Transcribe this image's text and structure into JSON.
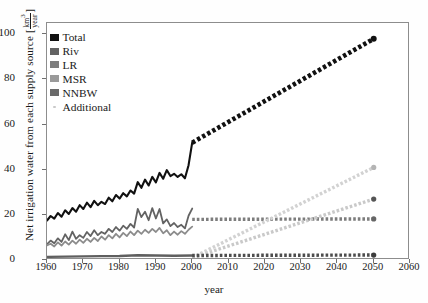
{
  "chart_data": {
    "type": "line",
    "title": "",
    "xlabel": "year",
    "ylabel": "Net irrigation water from each supply source",
    "yunit_num": "km",
    "yunit_num_sup": "3",
    "yunit_den": "year",
    "xlim": [
      1960,
      2060
    ],
    "ylim": [
      0,
      105
    ],
    "xticks": [
      1960,
      1970,
      1980,
      1990,
      2000,
      2010,
      2020,
      2030,
      2040,
      2050,
      2060
    ],
    "yticks": [
      0,
      20,
      40,
      60,
      80,
      100
    ],
    "grid": false,
    "legend_position": "top-left",
    "legend": [
      {
        "label": "Total",
        "color": "#111111",
        "marker": "square"
      },
      {
        "label": "Riv",
        "color": "#636363",
        "marker": "square"
      },
      {
        "label": "LR",
        "color": "#7d7d7d",
        "marker": "square"
      },
      {
        "label": "MSR",
        "color": "#9a9a9a",
        "marker": "square"
      },
      {
        "label": "NNBW",
        "color": "#6a6a6a",
        "marker": "square"
      },
      {
        "label": "Additional",
        "color": "#c9c9c9",
        "marker": "dot"
      }
    ],
    "series": [
      {
        "name": "Total",
        "color": "#111111",
        "style": "solid",
        "x": [
          1960,
          1961,
          1962,
          1963,
          1964,
          1965,
          1966,
          1967,
          1968,
          1969,
          1970,
          1971,
          1972,
          1973,
          1974,
          1975,
          1976,
          1977,
          1978,
          1979,
          1980,
          1981,
          1982,
          1983,
          1984,
          1985,
          1986,
          1987,
          1988,
          1989,
          1990,
          1991,
          1992,
          1993,
          1994,
          1995,
          1996,
          1997,
          1998,
          1999,
          2000
        ],
        "values": [
          17.5,
          19.5,
          18.3,
          20.8,
          19.2,
          22.0,
          20.4,
          23.0,
          21.4,
          24.3,
          22.6,
          25.4,
          23.4,
          26.2,
          24.3,
          25.8,
          24.8,
          27.6,
          26.0,
          28.8,
          27.2,
          29.6,
          28.2,
          30.8,
          29.4,
          34.5,
          32.0,
          35.6,
          33.0,
          36.8,
          34.4,
          38.6,
          36.0,
          39.8,
          37.2,
          38.2,
          36.8,
          38.0,
          36.2,
          42.0,
          52.0
        ]
      },
      {
        "name": "Total_projection",
        "color": "#111111",
        "style": "dotted",
        "x": [
          2000,
          2050
        ],
        "values": [
          52.0,
          98.0
        ]
      },
      {
        "name": "Riv",
        "color": "#636363",
        "style": "solid",
        "x": [
          1960,
          1961,
          1962,
          1963,
          1964,
          1965,
          1966,
          1967,
          1968,
          1969,
          1970,
          1971,
          1972,
          1973,
          1974,
          1975,
          1976,
          1977,
          1978,
          1979,
          1980,
          1981,
          1982,
          1983,
          1984,
          1985,
          1986,
          1987,
          1988,
          1989,
          1990,
          1991,
          1992,
          1993,
          1994,
          1995,
          1996,
          1997,
          1998,
          1999,
          2000
        ],
        "values": [
          7.0,
          8.6,
          7.4,
          9.6,
          8.0,
          11.4,
          8.8,
          12.6,
          9.4,
          11.0,
          9.8,
          12.4,
          10.6,
          13.2,
          11.0,
          12.4,
          11.6,
          13.8,
          12.4,
          14.6,
          13.0,
          15.2,
          13.8,
          16.0,
          14.4,
          22.6,
          19.0,
          21.4,
          17.6,
          23.0,
          18.4,
          22.6,
          16.2,
          18.0,
          15.0,
          16.4,
          14.6,
          15.6,
          14.0,
          19.6,
          22.8
        ]
      },
      {
        "name": "Riv_projection",
        "color": "#7d7d7d",
        "style": "dotted",
        "x": [
          2000,
          2050
        ],
        "values": [
          18.0,
          18.2
        ]
      },
      {
        "name": "LR",
        "color": "#8c8c8c",
        "style": "solid",
        "x": [
          1960,
          1961,
          1962,
          1963,
          1964,
          1965,
          1966,
          1967,
          1968,
          1969,
          1970,
          1971,
          1972,
          1973,
          1974,
          1975,
          1976,
          1977,
          1978,
          1979,
          1980,
          1981,
          1982,
          1983,
          1984,
          1985,
          1986,
          1987,
          1988,
          1989,
          1990,
          1991,
          1992,
          1993,
          1994,
          1995,
          1996,
          1997,
          1998,
          1999,
          2000
        ],
        "values": [
          6.5,
          7.2,
          6.0,
          7.8,
          6.4,
          8.2,
          6.8,
          8.6,
          7.2,
          9.0,
          7.6,
          9.4,
          8.0,
          9.8,
          8.4,
          10.4,
          9.0,
          11.0,
          9.6,
          11.6,
          10.0,
          12.0,
          10.6,
          12.6,
          11.0,
          13.0,
          11.6,
          13.4,
          12.0,
          13.8,
          12.4,
          14.2,
          11.8,
          13.2,
          11.0,
          12.6,
          11.2,
          12.8,
          11.6,
          13.4,
          14.8
        ]
      },
      {
        "name": "MSR_projection",
        "color": "#c9c9c9",
        "style": "dotted",
        "x": [
          2000,
          2050
        ],
        "values": [
          1.0,
          27.0
        ]
      },
      {
        "name": "Additional_projection",
        "color": "#d2d2d2",
        "style": "dotted",
        "x": [
          2000,
          2050
        ],
        "values": [
          1.0,
          41.0
        ]
      },
      {
        "name": "NNBW",
        "color": "#5f5f5f",
        "style": "solid",
        "x": [
          1960,
          1965,
          1970,
          1975,
          1980,
          1985,
          1990,
          1995,
          2000
        ],
        "values": [
          1.4,
          1.5,
          1.6,
          1.7,
          1.8,
          2.1,
          2.0,
          1.9,
          2.0
        ]
      },
      {
        "name": "NNBW_projection",
        "color": "#4d4d4d",
        "style": "dotted",
        "x": [
          2000,
          2050
        ],
        "values": [
          2.0,
          2.2
        ]
      }
    ],
    "endpoint_markers": [
      {
        "name": "Total",
        "x": 2050,
        "y": 98.0,
        "color": "#111111",
        "r": 3.0
      },
      {
        "name": "Additional",
        "x": 2050,
        "y": 41.0,
        "color": "#b4b4b4",
        "r": 2.6
      },
      {
        "name": "MSR",
        "x": 2050,
        "y": 27.0,
        "color": "#555555",
        "r": 2.6
      },
      {
        "name": "LR",
        "x": 2050,
        "y": 18.2,
        "color": "#666666",
        "r": 2.6
      },
      {
        "name": "NNBW",
        "x": 2050,
        "y": 2.2,
        "color": "#3d3d3d",
        "r": 2.6
      }
    ]
  }
}
